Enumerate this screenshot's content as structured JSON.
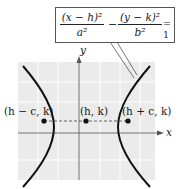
{
  "figure": {
    "type": "hyperbola-diagram",
    "equation": {
      "term1_numerator": "(x − h)²",
      "term1_denominator": "a²",
      "operator": "−",
      "term2_numerator": "(y − k)²",
      "term2_denominator": "b²",
      "equals": "= 1"
    },
    "axes": {
      "x_label": "x",
      "y_label": "y"
    },
    "points": [
      {
        "label": "(h − c, k)",
        "name": "left-focus"
      },
      {
        "label": "(h, k)",
        "name": "center"
      },
      {
        "label": "(h + c, k)",
        "name": "right-focus"
      }
    ],
    "colors": {
      "plot_background": "#ebebeb",
      "grid": "#ffffff",
      "curve": "#111111",
      "axis": "#555555",
      "dashed": "#555555"
    }
  }
}
